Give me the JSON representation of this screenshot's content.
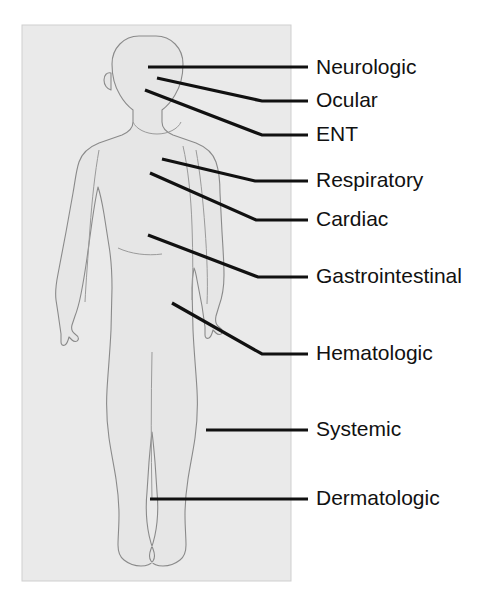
{
  "figure": {
    "panel": {
      "background_color": "#eaeaea",
      "border_color": "#cfcfcf",
      "x": 22,
      "y": 25,
      "width": 269,
      "height": 556
    },
    "body": {
      "fill_color": "#e6e6e6",
      "outline_color": "#8a8a8a",
      "view": "anterior",
      "pose": "standing, arms at sides, left arm extended slightly away"
    },
    "leader_line_color": "#111111",
    "label_color": "#111111"
  },
  "labels": [
    {
      "id": "neurologic",
      "text": "Neurologic",
      "target_region": "head-brain",
      "text_x": 316,
      "text_y": 68,
      "line": "148,67 308,67",
      "line_type": "straight"
    },
    {
      "id": "ocular",
      "text": "Ocular",
      "target_region": "head-eye",
      "text_x": 316,
      "text_y": 101,
      "line": "157,78 262,101 308,101",
      "line_type": "bent"
    },
    {
      "id": "ent",
      "text": "ENT",
      "target_region": "head-ear-nose-throat",
      "text_x": 316,
      "text_y": 135,
      "line": "145,90 262,135 308,135",
      "line_type": "bent"
    },
    {
      "id": "respiratory",
      "text": "Respiratory",
      "target_region": "chest-lungs",
      "text_x": 316,
      "text_y": 181,
      "line": "162,159 255,181 308,181",
      "line_type": "bent"
    },
    {
      "id": "cardiac",
      "text": "Cardiac",
      "target_region": "chest-heart",
      "text_x": 316,
      "text_y": 220,
      "line": "150,173 256,220 308,220",
      "line_type": "bent"
    },
    {
      "id": "gastrointestinal",
      "text": "Gastrointestinal",
      "target_region": "abdomen",
      "text_x": 316,
      "text_y": 277,
      "line": "148,235 258,277 308,277",
      "line_type": "bent"
    },
    {
      "id": "hematologic",
      "text": "Hematologic",
      "target_region": "pelvis-blood",
      "text_x": 316,
      "text_y": 354,
      "line": "172,303 262,354 308,354",
      "line_type": "bent"
    },
    {
      "id": "systemic",
      "text": "Systemic",
      "target_region": "whole-body",
      "text_x": 316,
      "text_y": 430,
      "line": "206,430 308,430",
      "line_type": "straight"
    },
    {
      "id": "dermatologic",
      "text": "Dermatologic",
      "target_region": "skin-lower-leg",
      "text_x": 316,
      "text_y": 499,
      "line": "150,499 308,499",
      "line_type": "straight"
    }
  ]
}
